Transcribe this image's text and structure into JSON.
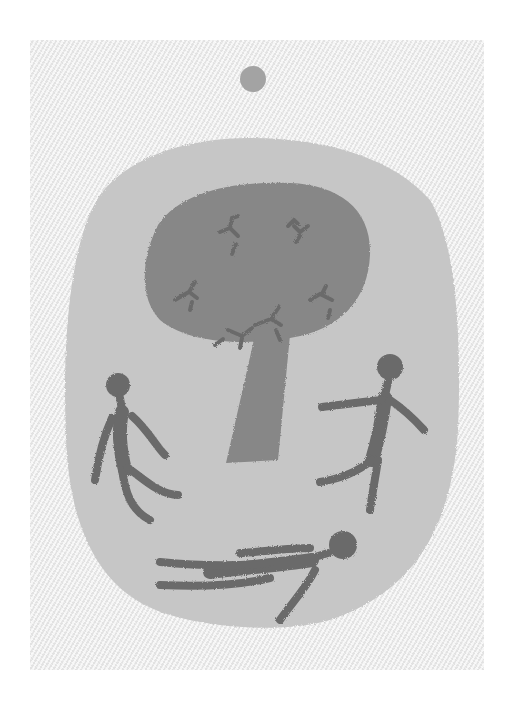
{
  "artwork": {
    "description": "Grayscale painting on textured linen canvas",
    "colors": {
      "canvas": "#eeeeee",
      "oval": "#c4c4c4",
      "tree": "#858585",
      "figures": "#6a6a6a",
      "birds": "#6e6e6e",
      "sun": "#a0a0a0"
    },
    "elements": [
      "sun-dot",
      "oval-field",
      "tree",
      "birds-in-crown",
      "standing-figure-left",
      "walking-figure-right",
      "lying-figure-bottom"
    ]
  }
}
